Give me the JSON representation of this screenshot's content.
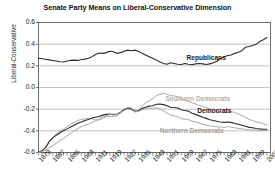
{
  "chart_data": {
    "type": "line",
    "title": "Senate Party Means on Liberal-Conservative Dimension",
    "xlabel": "",
    "ylabel": "Liberal-Conservative",
    "ylim": [
      -0.6,
      0.6
    ],
    "xlim": [
      1879,
      2009
    ],
    "yticks": [
      0.6,
      0.4,
      0.2,
      0.0,
      -0.2,
      -0.4,
      -0.6
    ],
    "ytick_labels": [
      "0.6",
      "0.4",
      "0.2",
      "0.0",
      "-0.2",
      "-0.4",
      "-0.6"
    ],
    "xticks": [
      1879,
      1887,
      1895,
      1903,
      1911,
      1919,
      1927,
      1935,
      1943,
      1951,
      1959,
      1967,
      1975,
      1983,
      1991,
      1999,
      2007
    ],
    "xtick_labels": [
      "1879",
      "1887",
      "1895",
      "1903",
      "1911",
      "1919",
      "1927",
      "1935",
      "1943",
      "1951",
      "1959",
      "1967",
      "1975",
      "1983",
      "1991",
      "1999",
      "2007"
    ],
    "minor_tick_step": 2,
    "grid": true,
    "grid_axis": "y",
    "legend_position": "inline-annotations",
    "x": [
      1879,
      1881,
      1883,
      1885,
      1887,
      1889,
      1891,
      1893,
      1895,
      1897,
      1899,
      1901,
      1903,
      1905,
      1907,
      1909,
      1911,
      1913,
      1915,
      1917,
      1919,
      1921,
      1923,
      1925,
      1927,
      1929,
      1931,
      1933,
      1935,
      1937,
      1939,
      1941,
      1943,
      1945,
      1947,
      1949,
      1951,
      1953,
      1955,
      1957,
      1959,
      1961,
      1963,
      1965,
      1967,
      1969,
      1971,
      1973,
      1975,
      1977,
      1979,
      1981,
      1983,
      1985,
      1987,
      1989,
      1991,
      1993,
      1995,
      1997,
      1999,
      2001,
      2003,
      2005,
      2007
    ],
    "series": [
      {
        "name": "Republicans",
        "color": "#2b2b2b",
        "width": 1.1,
        "label_x": 1962,
        "label_y": 0.265,
        "values": [
          0.27,
          0.265,
          0.26,
          0.255,
          0.25,
          0.245,
          0.238,
          0.235,
          0.245,
          0.25,
          0.253,
          0.25,
          0.258,
          0.262,
          0.27,
          0.285,
          0.305,
          0.318,
          0.315,
          0.322,
          0.335,
          0.33,
          0.315,
          0.322,
          0.335,
          0.345,
          0.34,
          0.345,
          0.335,
          0.315,
          0.3,
          0.285,
          0.27,
          0.255,
          0.235,
          0.222,
          0.215,
          0.228,
          0.222,
          0.215,
          0.212,
          0.222,
          0.215,
          0.21,
          0.218,
          0.222,
          0.218,
          0.212,
          0.218,
          0.228,
          0.242,
          0.268,
          0.282,
          0.295,
          0.3,
          0.315,
          0.325,
          0.34,
          0.372,
          0.378,
          0.388,
          0.4,
          0.425,
          0.44,
          0.462
        ]
      },
      {
        "name": "Southern Democrats",
        "color": "#a8a8a8",
        "width": 1.0,
        "label_x": 1950,
        "label_y": -0.108,
        "values": [
          -0.595,
          -0.585,
          -0.55,
          -0.495,
          -0.46,
          -0.43,
          -0.4,
          -0.385,
          -0.36,
          -0.34,
          -0.322,
          -0.305,
          -0.295,
          -0.29,
          -0.285,
          -0.288,
          -0.3,
          -0.3,
          -0.285,
          -0.268,
          -0.265,
          -0.268,
          -0.26,
          -0.235,
          -0.205,
          -0.185,
          -0.19,
          -0.225,
          -0.215,
          -0.175,
          -0.142,
          -0.125,
          -0.1,
          -0.075,
          -0.062,
          -0.055,
          -0.062,
          -0.075,
          -0.078,
          -0.085,
          -0.105,
          -0.118,
          -0.128,
          -0.142,
          -0.152,
          -0.165,
          -0.175,
          -0.185,
          -0.198,
          -0.205,
          -0.215,
          -0.225,
          -0.232,
          -0.225,
          -0.222,
          -0.232,
          -0.245,
          -0.258,
          -0.275,
          -0.295,
          -0.305,
          -0.318,
          -0.325,
          -0.335,
          -0.345
        ]
      },
      {
        "name": "Democrats",
        "color": "#2b2b2b",
        "width": 1.1,
        "label_x": 1968,
        "label_y": -0.225,
        "values": [
          -0.595,
          -0.585,
          -0.555,
          -0.5,
          -0.465,
          -0.44,
          -0.418,
          -0.4,
          -0.382,
          -0.365,
          -0.348,
          -0.33,
          -0.318,
          -0.305,
          -0.295,
          -0.282,
          -0.275,
          -0.268,
          -0.255,
          -0.248,
          -0.245,
          -0.25,
          -0.245,
          -0.228,
          -0.205,
          -0.192,
          -0.198,
          -0.218,
          -0.215,
          -0.195,
          -0.182,
          -0.172,
          -0.168,
          -0.155,
          -0.152,
          -0.158,
          -0.168,
          -0.182,
          -0.185,
          -0.19,
          -0.205,
          -0.212,
          -0.218,
          -0.238,
          -0.248,
          -0.262,
          -0.275,
          -0.285,
          -0.298,
          -0.305,
          -0.312,
          -0.318,
          -0.322,
          -0.318,
          -0.322,
          -0.332,
          -0.34,
          -0.348,
          -0.358,
          -0.368,
          -0.372,
          -0.378,
          -0.382,
          -0.385,
          -0.385
        ]
      },
      {
        "name": "Northern Democrats",
        "color": "#a8a8a8",
        "width": 1.0,
        "label_x": 1947,
        "label_y": -0.405,
        "values": [
          -0.598,
          -0.592,
          -0.578,
          -0.558,
          -0.535,
          -0.515,
          -0.49,
          -0.47,
          -0.445,
          -0.425,
          -0.4,
          -0.38,
          -0.362,
          -0.35,
          -0.338,
          -0.322,
          -0.305,
          -0.29,
          -0.272,
          -0.26,
          -0.248,
          -0.255,
          -0.248,
          -0.232,
          -0.212,
          -0.198,
          -0.205,
          -0.225,
          -0.222,
          -0.205,
          -0.198,
          -0.192,
          -0.192,
          -0.188,
          -0.195,
          -0.215,
          -0.235,
          -0.255,
          -0.262,
          -0.272,
          -0.288,
          -0.292,
          -0.295,
          -0.312,
          -0.318,
          -0.328,
          -0.338,
          -0.348,
          -0.355,
          -0.358,
          -0.362,
          -0.365,
          -0.368,
          -0.362,
          -0.365,
          -0.372,
          -0.378,
          -0.382,
          -0.388,
          -0.392,
          -0.392,
          -0.395,
          -0.398,
          -0.398,
          -0.398
        ]
      }
    ],
    "annotations": [
      {
        "text": "Republicans",
        "color": "#1a1a1a",
        "bold": true
      },
      {
        "text": "Southern Democrats",
        "color": "#b0b0b0",
        "bold": true
      },
      {
        "text": "Democrats",
        "color": "#1a1a1a",
        "bold": true
      },
      {
        "text": "Northern Democrats",
        "color": "#a0a0a0",
        "bold": true
      }
    ]
  },
  "style": {
    "background": "#ffffff",
    "grid_color": "#9a9a9a",
    "axis_color": "#4a4a4a",
    "text_color": "#222222"
  }
}
